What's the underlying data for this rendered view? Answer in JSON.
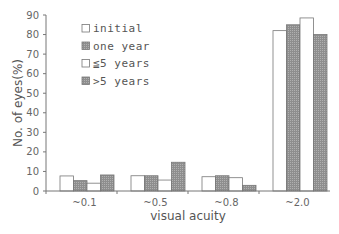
{
  "chart_data": {
    "type": "bar",
    "title": "",
    "xlabel": "visual acuity",
    "ylabel": "No. of eyes(%)",
    "ylim": [
      0,
      90
    ],
    "yticks": [
      0,
      10,
      20,
      30,
      40,
      50,
      60,
      70,
      80,
      90
    ],
    "grid": false,
    "legend_position": "upper-left-inside",
    "categories": [
      "~0.1",
      "~0.5",
      "~0.8",
      "~2.0"
    ],
    "series": [
      {
        "name": "initial",
        "color": "#ffffff",
        "values": [
          7.7,
          7.8,
          7.3,
          82
        ]
      },
      {
        "name": "one year",
        "color": "#999999",
        "values": [
          5.3,
          7.8,
          7.8,
          85
        ]
      },
      {
        "name": "≦5 years",
        "color": "#ffffff",
        "values": [
          4.0,
          5.6,
          6.8,
          88.5
        ]
      },
      {
        "name": ">5 years",
        "color": "#a0a0a0",
        "values": [
          8.2,
          14.7,
          2.9,
          80
        ]
      }
    ]
  }
}
